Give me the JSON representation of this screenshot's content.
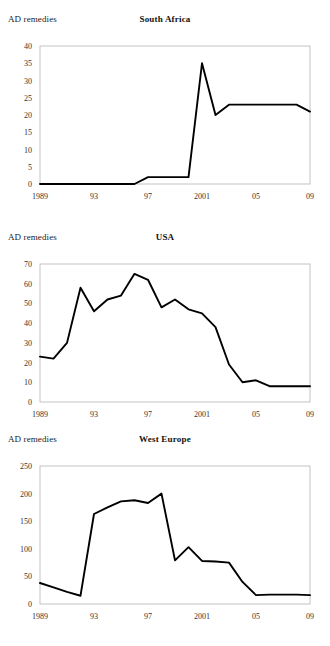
{
  "figure": {
    "y_axis_caption": "AD remedies",
    "panel_count": 3
  },
  "chart_data": [
    {
      "type": "line",
      "title": "South Africa",
      "xlabel": "",
      "ylabel": "AD remedies",
      "ylim": [
        0,
        40
      ],
      "yticks": [
        0,
        5,
        10,
        15,
        20,
        25,
        30,
        35,
        40
      ],
      "xlim": [
        1989,
        2009
      ],
      "xticks": [
        1989,
        1993,
        1997,
        2001,
        2005,
        2009
      ],
      "xticklabels": [
        "1989",
        "93",
        "97",
        "2001",
        "05",
        "09"
      ],
      "grid": false,
      "legend": "none",
      "x": [
        1989,
        1990,
        1991,
        1992,
        1993,
        1994,
        1995,
        1996,
        1997,
        1998,
        1999,
        2000,
        2001,
        2002,
        2003,
        2004,
        2005,
        2006,
        2007,
        2008,
        2009
      ],
      "values": [
        0,
        0,
        0,
        0,
        0,
        0,
        0,
        0,
        2,
        2,
        2,
        2,
        35,
        20,
        23,
        23,
        23,
        23,
        23,
        23,
        21
      ]
    },
    {
      "type": "line",
      "title": "USA",
      "xlabel": "",
      "ylabel": "AD remedies",
      "ylim": [
        0,
        70
      ],
      "yticks": [
        0,
        10,
        20,
        30,
        40,
        50,
        60,
        70
      ],
      "xlim": [
        1989,
        2009
      ],
      "xticks": [
        1989,
        1993,
        1997,
        2001,
        2005,
        2009
      ],
      "xticklabels": [
        "1989",
        "93",
        "97",
        "2001",
        "05",
        "09"
      ],
      "grid": false,
      "legend": "none",
      "x": [
        1989,
        1990,
        1991,
        1992,
        1993,
        1994,
        1995,
        1996,
        1997,
        1998,
        1999,
        2000,
        2001,
        2002,
        2003,
        2004,
        2005,
        2006,
        2007,
        2008,
        2009
      ],
      "values": [
        23,
        22,
        30,
        58,
        46,
        52,
        54,
        65,
        62,
        48,
        52,
        47,
        45,
        38,
        19,
        10,
        11,
        8,
        8,
        8,
        8
      ]
    },
    {
      "type": "line",
      "title": "West Europe",
      "xlabel": "",
      "ylabel": "AD remedies",
      "ylim": [
        0,
        250
      ],
      "yticks": [
        0,
        50,
        100,
        150,
        200,
        250
      ],
      "xlim": [
        1989,
        2009
      ],
      "xticks": [
        1989,
        1993,
        1997,
        2001,
        2005,
        2009
      ],
      "xticklabels": [
        "1989",
        "93",
        "97",
        "2001",
        "05",
        "09"
      ],
      "grid": false,
      "legend": "none",
      "x": [
        1989,
        1990,
        1991,
        1992,
        1993,
        1994,
        1995,
        1996,
        1997,
        1998,
        1999,
        2000,
        2001,
        2002,
        2003,
        2004,
        2005,
        2006,
        2007,
        2008,
        2009
      ],
      "values": [
        38,
        30,
        22,
        15,
        163,
        175,
        186,
        188,
        183,
        200,
        79,
        103,
        78,
        77,
        75,
        40,
        16,
        17,
        17,
        17,
        16
      ]
    }
  ]
}
